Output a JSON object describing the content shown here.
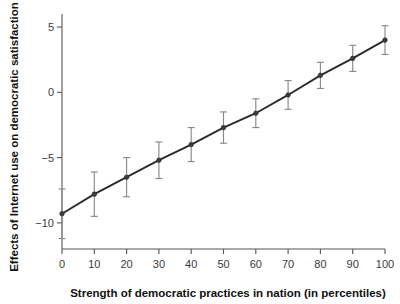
{
  "chart_data": {
    "type": "line",
    "title": "",
    "subtitle": "",
    "xlabel": "Strength of democratic practices in nation (in percentiles)",
    "ylabel": "Effects of Internet use on democratic satisfaction",
    "x": [
      0,
      10,
      20,
      30,
      40,
      50,
      60,
      70,
      80,
      90,
      100
    ],
    "values": [
      -9.3,
      -7.8,
      -6.5,
      -5.2,
      -4.0,
      -2.7,
      -1.6,
      -0.2,
      1.3,
      2.6,
      4.0
    ],
    "series": [
      {
        "name": "Marginal effect of Internet use",
        "values": [
          -9.3,
          -7.8,
          -6.5,
          -5.2,
          -4.0,
          -2.7,
          -1.6,
          -0.2,
          1.3,
          2.6,
          4.0
        ],
        "err_low": [
          -11.2,
          -9.5,
          -8.0,
          -6.6,
          -5.3,
          -3.9,
          -2.7,
          -1.3,
          0.3,
          1.6,
          2.9
        ],
        "err_high": [
          -7.4,
          -6.1,
          -5.0,
          -3.8,
          -2.7,
          -1.5,
          -0.5,
          0.9,
          2.3,
          3.6,
          5.1
        ]
      }
    ],
    "xlim": [
      0,
      100
    ],
    "ylim": [
      -12.0,
      6.0
    ],
    "xticks": [
      0,
      10,
      20,
      30,
      40,
      50,
      60,
      70,
      80,
      90,
      100
    ],
    "xticklabels": [
      "0",
      "10",
      "20",
      "30",
      "40",
      "50",
      "60",
      "70",
      "80",
      "90",
      "100"
    ],
    "yticks": [
      5,
      0,
      -5,
      -10
    ],
    "yticklabels": [
      "5",
      "0",
      "−5",
      "−10"
    ],
    "grid": false,
    "legend": false,
    "legend_position": "none",
    "error_bars": true,
    "marker": "circle",
    "line_color": "#2b2b2b",
    "error_color": "#8a8a8a",
    "marker_color": "#3c3c3c",
    "background_color": "#ffffff",
    "annotations": []
  }
}
